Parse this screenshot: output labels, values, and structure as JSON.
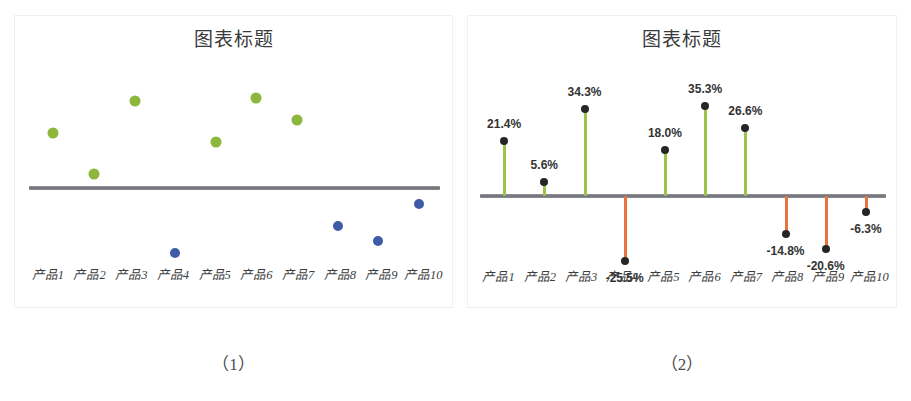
{
  "figure": {
    "background": "#ffffff",
    "panels": [
      {
        "id": "panel-1",
        "caption": "（1）",
        "title": "图表标题"
      },
      {
        "id": "panel-2",
        "caption": "（2）",
        "title": "图表标题"
      }
    ]
  },
  "colors": {
    "positive_dot": "#8cb63c",
    "negative_dot": "#3f5aa6",
    "positive_stem": "#9bc54a",
    "negative_stem": "#e8733c",
    "marker": "#262626",
    "baseline": "#6f6f76",
    "label_text": "#333333",
    "title_text": "#3a3a3a"
  },
  "chart_data": [
    {
      "type": "scatter",
      "title": "图表标题",
      "xlabel": "",
      "ylabel": "",
      "categories": [
        "产品1",
        "产品2",
        "产品3",
        "产品4",
        "产品5",
        "产品6",
        "产品7",
        "产品8",
        "产品9",
        "产品10"
      ],
      "values": [
        21.4,
        5.6,
        34.3,
        -25.5,
        18.0,
        35.3,
        26.6,
        -14.8,
        -20.6,
        -6.3
      ],
      "ylim": [
        -30,
        40
      ],
      "grid": false,
      "legend": "none",
      "series": [
        {
          "name": "正值",
          "color": "#8cb63c",
          "points": [
            {
              "category": "产品1",
              "value": 21.4
            },
            {
              "category": "产品2",
              "value": 5.6
            },
            {
              "category": "产品3",
              "value": 34.3
            },
            {
              "category": "产品5",
              "value": 18.0
            },
            {
              "category": "产品6",
              "value": 35.3
            },
            {
              "category": "产品7",
              "value": 26.6
            }
          ]
        },
        {
          "name": "负值",
          "color": "#3f5aa6",
          "points": [
            {
              "category": "产品4",
              "value": -25.5
            },
            {
              "category": "产品8",
              "value": -14.8
            },
            {
              "category": "产品9",
              "value": -20.6
            },
            {
              "category": "产品10",
              "value": -6.3
            }
          ]
        }
      ]
    },
    {
      "type": "bar",
      "subtype": "stem-lollipop",
      "title": "图表标题",
      "xlabel": "",
      "ylabel": "",
      "categories": [
        "产品1",
        "产品2",
        "产品3",
        "产品4",
        "产品5",
        "产品6",
        "产品7",
        "产品8",
        "产品9",
        "产品10"
      ],
      "values": [
        21.4,
        5.6,
        34.3,
        -25.5,
        18.0,
        35.3,
        26.6,
        -14.8,
        -20.6,
        -6.3
      ],
      "data_labels": [
        "21.4%",
        "5.6%",
        "34.3%",
        "-25.5%",
        "18.0%",
        "35.3%",
        "26.6%",
        "-14.8%",
        "-20.6%",
        "-6.3%"
      ],
      "ylim": [
        -30,
        40
      ],
      "grid": false,
      "legend": "none"
    }
  ]
}
